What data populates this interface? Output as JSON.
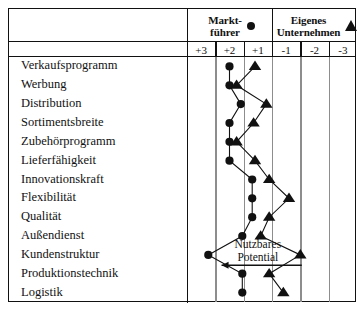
{
  "figure": {
    "legend": {
      "leader": {
        "line1": "Markt-",
        "line2": "führer",
        "marker": "filled-circle"
      },
      "own": {
        "line1": "Eigenes",
        "line2": "Unternehmen",
        "marker": "filled-triangle"
      }
    },
    "annotation": {
      "line1": "Nutzbares",
      "line2": "Potential",
      "arrow": "left-arrow"
    },
    "colors": {
      "ink": "#111111",
      "grid": "#8d8d8d",
      "background": "#ffffff"
    }
  },
  "chart_data": {
    "type": "line",
    "title": "",
    "xlabel": "",
    "ylabel": "",
    "orientation": "horizontal-profile",
    "scale_labels": [
      "+3",
      "+2",
      "+1",
      "-1",
      "-2",
      "-3"
    ],
    "scale_values": [
      3,
      2,
      1,
      -1,
      -2,
      -3
    ],
    "grid": true,
    "legend_position": "top",
    "categories": [
      "Verkaufsprogramm",
      "Werbung",
      "Distribution",
      "Sortimentsbreite",
      "Zubehörprogramm",
      "Lieferfähigkeit",
      "Innovationskraft",
      "Flexibilität",
      "Qualität",
      "Außendienst",
      "Kundenstruktur",
      "Produktionstechnik",
      "Logistik"
    ],
    "series": [
      {
        "name": "Marktführer",
        "marker": "circle",
        "values": [
          2,
          2,
          1.6,
          2,
          2,
          2,
          1.2,
          1.2,
          1.2,
          1.55,
          2.75,
          1.55,
          1.55
        ]
      },
      {
        "name": "Eigenes Unternehmen",
        "marker": "triangle",
        "values": [
          1.1,
          1.75,
          0.7,
          1.15,
          1.75,
          1.1,
          -0.4,
          -1.1,
          -0.4,
          -0.1,
          -1.5,
          -0.4,
          -0.9
        ]
      }
    ]
  }
}
